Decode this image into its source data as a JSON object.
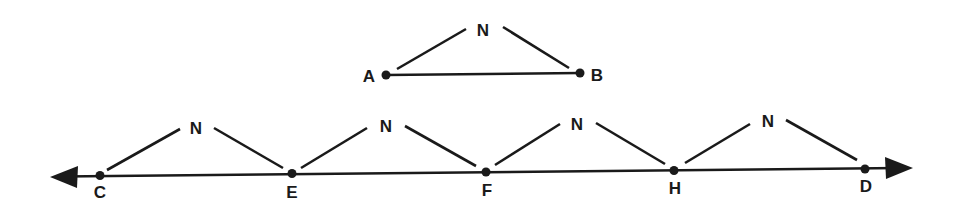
{
  "diagram": {
    "top_triangle": {
      "apex_label": "N",
      "left_label": "A",
      "right_label": "B"
    },
    "number_line": {
      "points": [
        {
          "label": "C"
        },
        {
          "label": "E"
        },
        {
          "label": "F"
        },
        {
          "label": "H"
        },
        {
          "label": "D"
        }
      ],
      "apex_labels": [
        "N",
        "N",
        "N",
        "N"
      ],
      "arrows": "both"
    }
  }
}
